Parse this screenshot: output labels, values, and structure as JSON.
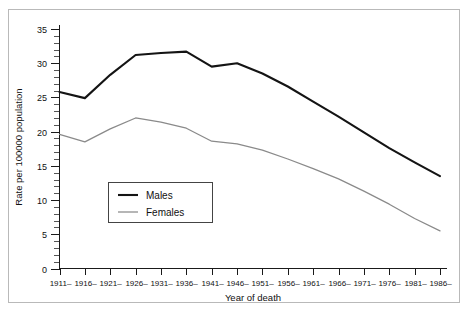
{
  "chart_data": {
    "type": "line",
    "title": "",
    "xlabel": "Year of death",
    "ylabel": "Rate per 100000 population",
    "categories": [
      "1911–",
      "1916–",
      "1921–",
      "1926–",
      "1931–",
      "1936–",
      "1941–",
      "1946–",
      "1951–",
      "1956–",
      "1961–",
      "1966–",
      "1971–",
      "1976–",
      "1981–",
      "1986–"
    ],
    "series": [
      {
        "name": "Males",
        "color": "#141414",
        "values": [
          25.8,
          24.9,
          28.3,
          31.2,
          31.5,
          31.7,
          29.5,
          30.0,
          28.5,
          26.6,
          24.4,
          22.2,
          19.9,
          17.6,
          15.5,
          13.5
        ]
      },
      {
        "name": "Females",
        "color": "#8a8a8a",
        "values": [
          19.6,
          18.5,
          20.4,
          22.0,
          21.4,
          20.5,
          18.6,
          18.2,
          17.3,
          16.0,
          14.6,
          13.1,
          11.3,
          9.4,
          7.3,
          5.5
        ]
      }
    ],
    "ylim": [
      0,
      35
    ],
    "yticks": [
      0,
      5,
      10,
      15,
      20,
      25,
      30,
      35
    ],
    "ytick_labels": [
      "0",
      "5",
      "10",
      "15",
      "20",
      "25",
      "30",
      "35"
    ],
    "y_minor_interval": 1,
    "grid": false,
    "legend_position": "inside-left-lower",
    "legend_entries": [
      "Males",
      "Females"
    ],
    "axis_color": "#1a1a1a",
    "background_color": "#ffffff",
    "frame_color": "#b9b9b9"
  }
}
